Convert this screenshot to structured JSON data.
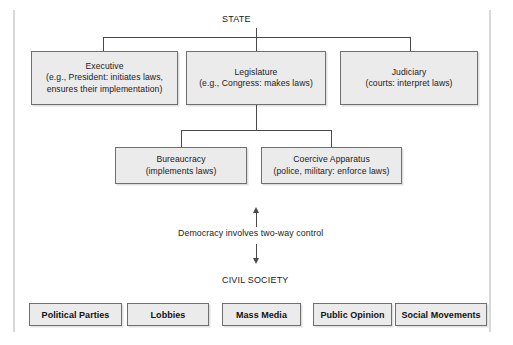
{
  "diagram": {
    "root": {
      "label": "STATE"
    },
    "branches": [
      {
        "name": "executive",
        "lines": [
          "Executive",
          "(e.g., President: initiates laws,",
          "ensures their implementation)"
        ]
      },
      {
        "name": "legislature",
        "lines": [
          "Legislature",
          "(e.g., Congress: makes laws)"
        ]
      },
      {
        "name": "judiciary",
        "lines": [
          "Judiciary",
          "(courts: interpret laws)"
        ]
      }
    ],
    "sub_branches": [
      {
        "name": "bureaucracy",
        "lines": [
          "Bureaucracy",
          "(implements laws)"
        ]
      },
      {
        "name": "coercive-apparatus",
        "lines": [
          "Coercive Apparatus",
          "(police, military: enforce laws)"
        ]
      }
    ],
    "middle_caption": "Democracy involves two-way control",
    "civil_society_heading": "CIVIL SOCIETY",
    "civil_society_items": [
      {
        "label": "Political Parties"
      },
      {
        "label": "Lobbies"
      },
      {
        "label": "Mass Media"
      },
      {
        "label": "Public Opinion"
      },
      {
        "label": "Social Movements"
      }
    ]
  },
  "colors": {
    "box_fill": "#ebebeb",
    "box_border": "#6f6f6f",
    "connector": "#4a4a4a",
    "text": "#1a1a1a",
    "background": "#ffffff"
  }
}
